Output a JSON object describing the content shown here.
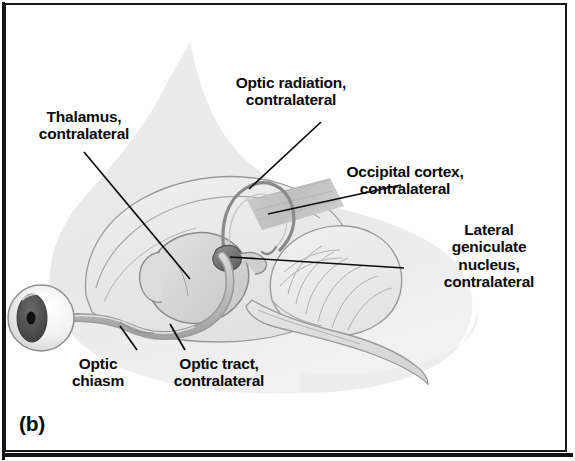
{
  "figure": {
    "panel_letter": "(b)",
    "background_color": "#fefefe",
    "frame_color": "#17181a",
    "ink_color": "#0a0a0a",
    "head_fill": "#e9e9e9",
    "brain_fill": "#ececec",
    "thalamus_fill": "#d8d8d8",
    "occipital_band_fill": "#c4c4c4",
    "lgn_fill": "#6f6f6f",
    "pupil_fill": "#111111",
    "iris_fill": "#4a4a4a",
    "sclera_fill": "#f3f3f3",
    "outline_color": "#8a8a8a"
  },
  "labels": [
    {
      "id": "thalamus",
      "lines": [
        "Thalamus,",
        "contralateral"
      ],
      "text": "Thalamus,\ncontralateral",
      "align": "center",
      "x": 30,
      "y": 108,
      "leader": {
        "x1": 84,
        "y1": 152,
        "x2": 190,
        "y2": 279
      }
    },
    {
      "id": "optic-radiation",
      "lines": [
        "Optic radiation,",
        "contralateral"
      ],
      "text": "Optic radiation,\ncontralateral",
      "align": "center",
      "x": 277,
      "y": 74,
      "leader": {
        "x1": 321,
        "y1": 122,
        "x2": 249,
        "y2": 189
      }
    },
    {
      "id": "occipital-cortex",
      "lines": [
        "Occipital cortex,",
        "contralateral"
      ],
      "text": "Occipital cortex,\ncontralateral",
      "align": "center",
      "x": 400,
      "y": 163,
      "leader": {
        "x1": 401,
        "y1": 185,
        "x2": 268,
        "y2": 214
      }
    },
    {
      "id": "lateral-geniculate-nucleus",
      "lines": [
        "Lateral",
        "geniculate",
        "nucleus,",
        "contralateral"
      ],
      "text": "Lateral\ngeniculate\nnucleus,\ncontralateral",
      "align": "center",
      "x": 449,
      "y": 221,
      "leader": {
        "x1": 404,
        "y1": 268,
        "x2": 230,
        "y2": 257
      }
    },
    {
      "id": "optic-chiasm",
      "lines": [
        "Optic",
        "chiasm"
      ],
      "text": "Optic\nchiasm",
      "align": "center",
      "x": 92,
      "y": 355,
      "leader": {
        "x1": 137,
        "y1": 350,
        "x2": 120,
        "y2": 326
      }
    },
    {
      "id": "optic-tract",
      "lines": [
        "Optic tract,",
        "contralateral"
      ],
      "text": "Optic tract,\ncontralateral",
      "align": "center",
      "x": 163,
      "y": 355,
      "leader": {
        "x1": 185,
        "y1": 350,
        "x2": 170,
        "y2": 324
      }
    }
  ]
}
